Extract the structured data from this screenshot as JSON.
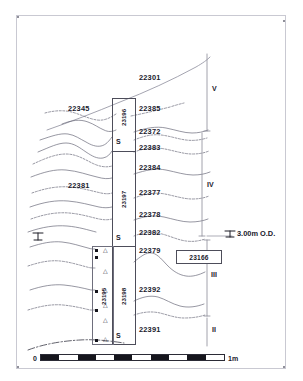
{
  "drawing": {
    "title": "Archaeological section drawing",
    "datum": {
      "label": "3.00m O.D.",
      "symbol": "datum-level-mark"
    },
    "left_datum_symbol": "datum-level-mark"
  },
  "contexts": [
    {
      "id": "22301",
      "x": 139,
      "y": 74,
      "name": "context-22301"
    },
    {
      "id": "22345",
      "x": 68,
      "y": 105,
      "name": "context-22345"
    },
    {
      "id": "22385",
      "x": 139,
      "y": 105,
      "name": "context-22385"
    },
    {
      "id": "22372",
      "x": 139,
      "y": 128,
      "name": "context-22372"
    },
    {
      "id": "22383",
      "x": 139,
      "y": 147,
      "name": "context-22383"
    },
    {
      "id": "22384",
      "x": 139,
      "y": 166,
      "name": "context-22384"
    },
    {
      "id": "22381",
      "x": 68,
      "y": 183,
      "name": "context-22381"
    },
    {
      "id": "22377",
      "x": 139,
      "y": 190,
      "name": "context-22377"
    },
    {
      "id": "22378",
      "x": 139,
      "y": 212,
      "name": "context-22378"
    },
    {
      "id": "22382",
      "x": 139,
      "y": 230,
      "name": "context-22382"
    },
    {
      "id": "22379",
      "x": 139,
      "y": 249,
      "name": "context-22379"
    },
    {
      "id": "22392",
      "x": 139,
      "y": 288,
      "name": "context-22392"
    },
    {
      "id": "22391",
      "x": 139,
      "y": 327,
      "name": "context-22391"
    }
  ],
  "sample_columns": [
    {
      "id": "23196",
      "name": "sample-column-23196",
      "left": 112,
      "top": 98,
      "width": 22,
      "height": 52,
      "label_x": 119,
      "label_y": 108
    },
    {
      "id": "23197",
      "name": "sample-column-23197",
      "left": 112,
      "top": 151,
      "width": 22,
      "height": 94,
      "label_x": 119,
      "label_y": 183
    },
    {
      "id": "23198",
      "name": "sample-column-23198",
      "left": 112,
      "top": 246,
      "width": 22,
      "height": 97,
      "label_x": 119,
      "label_y": 280
    },
    {
      "id": "23195",
      "name": "sample-column-23195",
      "left": 92,
      "top": 246,
      "width": 20,
      "height": 97,
      "label_x": 98,
      "label_y": 283
    }
  ],
  "s_markers": [
    {
      "label": "S",
      "x": 116,
      "y": 142,
      "name": "s-marker-top"
    },
    {
      "label": "S",
      "x": 116,
      "y": 238,
      "name": "s-marker-middle"
    },
    {
      "label": "S",
      "x": 116,
      "y": 336,
      "name": "s-marker-bottom"
    }
  ],
  "phases": [
    {
      "numeral": "V",
      "x": 215,
      "y": 86,
      "top": 54,
      "bottom": 131,
      "name": "phase-bracket-V"
    },
    {
      "numeral": "IV",
      "x": 215,
      "y": 204,
      "top": 133,
      "bottom": 236,
      "name": "phase-bracket-IV"
    },
    {
      "numeral": "III",
      "x": 215,
      "y": 273,
      "top": 240,
      "bottom": 316,
      "name": "phase-bracket-III"
    },
    {
      "numeral": "II",
      "x": 215,
      "y": 327,
      "top": 318,
      "bottom": 346,
      "name": "phase-bracket-II"
    }
  ],
  "find_label": {
    "id": "23166",
    "name": "find-label-23166",
    "left": 176,
    "top": 250,
    "width": 44,
    "height": 12
  },
  "datum_marker": {
    "text": "3.00m O.D.",
    "x": 238,
    "y": 234,
    "name": "datum-3-00m-od"
  },
  "scale": {
    "zero_label": "0",
    "end_label": "1m",
    "segments": [
      "on",
      "off",
      "on",
      "off",
      "on",
      "off",
      "on",
      "off",
      "on",
      "off"
    ],
    "left": 40,
    "top": 354,
    "width": 185
  },
  "sample_tins": {
    "squares_x": 95,
    "squares_y": [
      249,
      256,
      290,
      309,
      339
    ],
    "triangles_x": 103,
    "triangles_y": [
      248,
      269,
      288,
      303,
      318,
      333
    ]
  }
}
